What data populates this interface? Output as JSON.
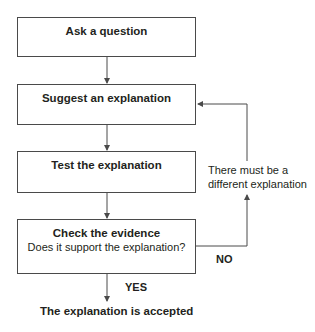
{
  "boxes": [
    {
      "title": "Ask a question"
    },
    {
      "title": "Suggest an explanation"
    },
    {
      "title": "Test the explanation"
    },
    {
      "title": "Check the evidence",
      "subtitle": "Does it support the explanation?"
    }
  ],
  "labels": {
    "loop_note_line1": "There must be a",
    "loop_note_line2": "different explanation",
    "no": "NO",
    "yes": "YES",
    "outcome": "The explanation is accepted"
  },
  "colors": {
    "line": "#4a4a4a",
    "text": "#231f20"
  }
}
